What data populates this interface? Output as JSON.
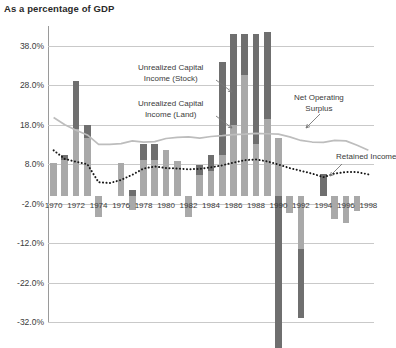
{
  "chart_data": {
    "type": "bar",
    "title": "As a percentage of GDP",
    "subtitle": "",
    "xlabel": "",
    "ylabel": "",
    "ylim": [
      -32.0,
      43.0
    ],
    "ytick_values": [
      38.0,
      28.0,
      18.0,
      8.0,
      -2.0,
      -12.0,
      -22.0,
      -32.0
    ],
    "ytick_labels": [
      "38.0%",
      "28.0%",
      "18.0%",
      "8.0%",
      "-2.0%",
      "-12.0%",
      "-22.0%",
      "-32.0%"
    ],
    "grid": true,
    "legend_position": "annotations-inline",
    "categories": [
      1970,
      1971,
      1972,
      1973,
      1974,
      1975,
      1976,
      1977,
      1978,
      1979,
      1980,
      1981,
      1982,
      1983,
      1984,
      1985,
      1986,
      1987,
      1988,
      1989,
      1990,
      1991,
      1992,
      1993,
      1994,
      1995,
      1996,
      1997,
      1998
    ],
    "xtick_labels": [
      "1970",
      "1972",
      "1974",
      "1976",
      "1978",
      "1980",
      "1982",
      "1984",
      "1986",
      "1988",
      "1990",
      "1992",
      "1994",
      "1996",
      "1998"
    ],
    "series": [
      {
        "name": "Unrealized Capital Income (Land)",
        "type": "bar-stacked",
        "color": "#a9a9a9",
        "values": [
          8.2,
          9.0,
          17.0,
          14.5,
          -5.5,
          0.0,
          8.3,
          -3.6,
          9.0,
          9.0,
          11.5,
          8.8,
          -5.5,
          5.3,
          6.3,
          10.4,
          18.0,
          30.5,
          13.0,
          19.5,
          14.5,
          -4.5,
          -13.5,
          0.0,
          0.0,
          -6.0,
          -7.0,
          -4.0,
          0.0
        ]
      },
      {
        "name": "Unrealized Capital Income (Stock)",
        "type": "bar-stacked",
        "color": "#6f6f6f",
        "values": [
          0.0,
          1.2,
          12.0,
          3.5,
          0.0,
          0.0,
          0.0,
          1.5,
          4.0,
          4.0,
          0.0,
          0.0,
          0.0,
          2.5,
          4.0,
          23.5,
          23.0,
          10.5,
          28.0,
          22.0,
          -38.5,
          0.0,
          -17.5,
          0.0,
          5.5,
          0.0,
          0.0,
          0.0,
          0.0
        ]
      },
      {
        "name": "Net Operating Surplus",
        "type": "line",
        "color": "#bdbdbd",
        "values": [
          19.8,
          18.0,
          16.6,
          15.4,
          13.0,
          13.0,
          13.2,
          13.9,
          13.6,
          13.7,
          14.5,
          14.8,
          14.9,
          14.6,
          15.0,
          15.2,
          15.5,
          15.6,
          15.8,
          15.7,
          15.6,
          14.9,
          14.0,
          13.6,
          13.5,
          14.0,
          13.9,
          12.8,
          11.5
        ]
      },
      {
        "name": "Retained Income",
        "type": "line-dotted",
        "color": "#1a1a1a",
        "values": [
          11.5,
          9.3,
          8.6,
          8.0,
          3.4,
          3.2,
          4.0,
          5.3,
          6.9,
          7.4,
          7.0,
          6.9,
          6.7,
          6.8,
          7.2,
          7.7,
          8.4,
          9.0,
          9.2,
          8.7,
          7.9,
          7.0,
          6.3,
          5.6,
          4.7,
          5.6,
          6.0,
          6.0,
          5.4
        ]
      }
    ],
    "annotations": [
      {
        "id": "ann-stock",
        "text_line1": "Unrealized Capital",
        "text_line2": "Income (Stock)"
      },
      {
        "id": "ann-land",
        "text_line1": "Unrealized Capital",
        "text_line2": "Income (Land)"
      },
      {
        "id": "ann-nos",
        "text_line1": "Net Operating",
        "text_line2": "Surplus"
      },
      {
        "id": "ann-retained",
        "text_line1": "Retained Income",
        "text_line2": ""
      }
    ]
  }
}
